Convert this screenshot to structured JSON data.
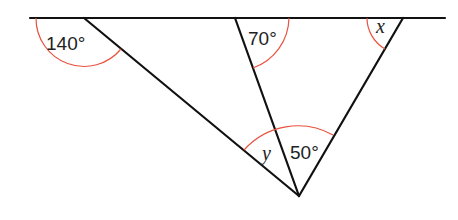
{
  "diagram": {
    "colors": {
      "line": "#111111",
      "arc": "#e8523f",
      "text": "#222222"
    },
    "labels": {
      "angle_140": "140°",
      "angle_70": "70°",
      "angle_x": "x",
      "angle_y": "y",
      "angle_50": "50°"
    },
    "points": {
      "line_start": [
        30,
        18
      ],
      "line_end": [
        445,
        18
      ],
      "A": [
        84,
        18
      ],
      "B": [
        235,
        18
      ],
      "C": [
        403,
        18
      ],
      "P": [
        299,
        196
      ]
    }
  }
}
